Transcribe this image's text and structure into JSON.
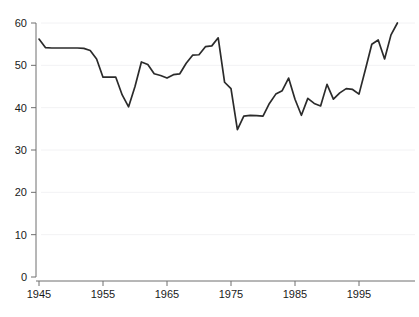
{
  "chart_data": {
    "type": "line",
    "title": "",
    "subtitle": "",
    "xlabel": "",
    "ylabel": "",
    "xlim": [
      1945,
      2001
    ],
    "ylim": [
      0,
      60
    ],
    "grid": true,
    "legend": "none",
    "x_ticks": [
      1945,
      1955,
      1965,
      1975,
      1985,
      1995
    ],
    "y_ticks": [
      0,
      10,
      20,
      30,
      40,
      50,
      60
    ],
    "x": [
      1945,
      1946,
      1947,
      1948,
      1949,
      1950,
      1951,
      1952,
      1953,
      1954,
      1955,
      1956,
      1957,
      1958,
      1959,
      1960,
      1961,
      1962,
      1963,
      1964,
      1965,
      1966,
      1967,
      1968,
      1969,
      1970,
      1971,
      1972,
      1973,
      1974,
      1975,
      1976,
      1977,
      1978,
      1979,
      1980,
      1981,
      1982,
      1983,
      1984,
      1985,
      1986,
      1987,
      1988,
      1989,
      1990,
      1991,
      1992,
      1993,
      1994,
      1995,
      1996,
      1997,
      1998,
      1999,
      2000,
      2001
    ],
    "values": [
      56.2,
      54.2,
      54.1,
      54.1,
      54.1,
      54.1,
      54.1,
      54.0,
      53.5,
      51.5,
      47.2,
      47.2,
      47.2,
      43.0,
      40.2,
      45.0,
      50.8,
      50.2,
      48.0,
      47.6,
      47.0,
      47.8,
      48.0,
      50.5,
      52.4,
      52.5,
      54.4,
      54.6,
      56.5,
      46.0,
      44.5,
      34.8,
      38.0,
      38.2,
      38.1,
      38.0,
      41.0,
      43.2,
      44.0,
      47.0,
      42.0,
      38.2,
      42.2,
      41.0,
      40.4,
      45.5,
      42.0,
      43.5,
      44.5,
      44.3,
      43.2,
      49.0,
      55.0,
      56.0,
      51.5,
      57.2,
      60.0
    ],
    "series_name": "series-1",
    "line_color": "#2b2b2b",
    "background_color": "#ffffff",
    "grid_color": "#f2f2f4",
    "axis_color": "#6f6f6f"
  }
}
